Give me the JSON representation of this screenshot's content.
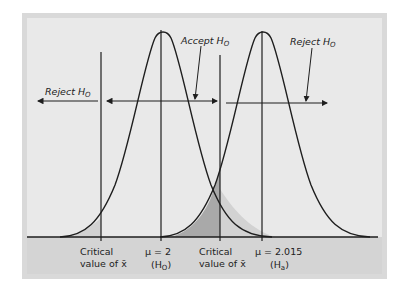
{
  "diagram": {
    "title": "",
    "colors": {
      "frame": "#d9d9d9",
      "panel": "#e9e9e9",
      "bottom_band": "#d4d4d4",
      "ink": "#1e1e1e",
      "beta_shade": "#a9a9a9",
      "alpha_shade": "#d2d2d2"
    },
    "labels": {
      "reject_left": "Reject H",
      "reject_left_sub": "O",
      "accept": "Accept H",
      "accept_sub": "O",
      "reject_right": "Reject H",
      "reject_right_sub": "O"
    },
    "axis_labels": {
      "crit_left_line1": "Critical",
      "crit_left_line2": "value of x̄",
      "mu0_line1": "μ = 2",
      "mu0_line2": "(H",
      "mu0_sub": "O",
      "mu0_close": ")",
      "crit_right_line1": "Critical",
      "crit_right_line2": "value of x̄",
      "mua_line1": "μ = 2.015",
      "mua_line2": "(H",
      "mua_sub": "a",
      "mua_close": ")"
    },
    "curves": [
      {
        "name": "null-distribution",
        "mean_label": "μ = 2",
        "hypothesis": "H0"
      },
      {
        "name": "alternative-distribution",
        "mean_label": "μ = 2.015",
        "hypothesis": "Ha"
      }
    ]
  }
}
